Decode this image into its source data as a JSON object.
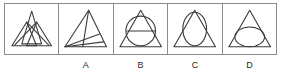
{
  "sheet": {
    "name": "figure-series-question",
    "background_color": "#ffffff",
    "border_color": "#8a8a8a",
    "stroke_color": "#3a3a3a"
  },
  "panels": [
    {
      "id": "question-figure",
      "label": "",
      "description": "overlapping slanted narrow triangles crossing in a lattice pattern"
    },
    {
      "id": "option-a",
      "label": "A",
      "description": "triangle with internal lines radiating from the bottom-left vertex"
    },
    {
      "id": "option-b",
      "label": "B",
      "description": "triangle containing a circle and a horizontal chord"
    },
    {
      "id": "option-c",
      "label": "C",
      "description": "triangle containing a tall oval touching both slanted sides"
    },
    {
      "id": "option-d",
      "label": "D",
      "description": "triangle containing a wide ellipse resting on the base"
    }
  ]
}
